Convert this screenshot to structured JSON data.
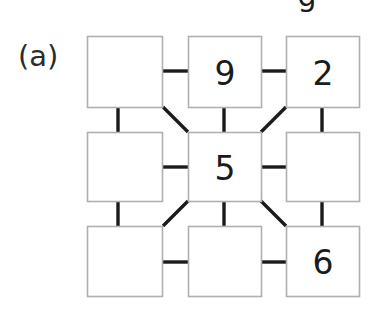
{
  "figure": {
    "panel_label": "(a)",
    "clipped_top_glyph": "g",
    "background_color": "#ffffff",
    "box_border_color": "#b0b0b0",
    "box_fill_color": "#ffffff",
    "connector_color": "#1b1b1b",
    "digit_color": "#1b1b1b",
    "label_color": "#2b2b2b"
  },
  "grid": {
    "rows": 3,
    "cols": 3,
    "cells": [
      {
        "id": "cell-r1c1",
        "row": 1,
        "col": 1,
        "value": ""
      },
      {
        "id": "cell-r1c2",
        "row": 1,
        "col": 2,
        "value": "9"
      },
      {
        "id": "cell-r1c3",
        "row": 1,
        "col": 3,
        "value": "2"
      },
      {
        "id": "cell-r2c1",
        "row": 2,
        "col": 1,
        "value": ""
      },
      {
        "id": "cell-r2c2",
        "row": 2,
        "col": 2,
        "value": "5"
      },
      {
        "id": "cell-r2c3",
        "row": 2,
        "col": 3,
        "value": ""
      },
      {
        "id": "cell-r3c1",
        "row": 3,
        "col": 1,
        "value": ""
      },
      {
        "id": "cell-r3c2",
        "row": 3,
        "col": 2,
        "value": ""
      },
      {
        "id": "cell-r3c3",
        "row": 3,
        "col": 3,
        "value": "6"
      }
    ]
  },
  "connectors": {
    "orthogonal_count": 8,
    "diagonal_count": 4,
    "note": "horizontal and vertical links join orthogonally adjacent boxes; four diagonals join the centre box corners to the corner boxes"
  }
}
